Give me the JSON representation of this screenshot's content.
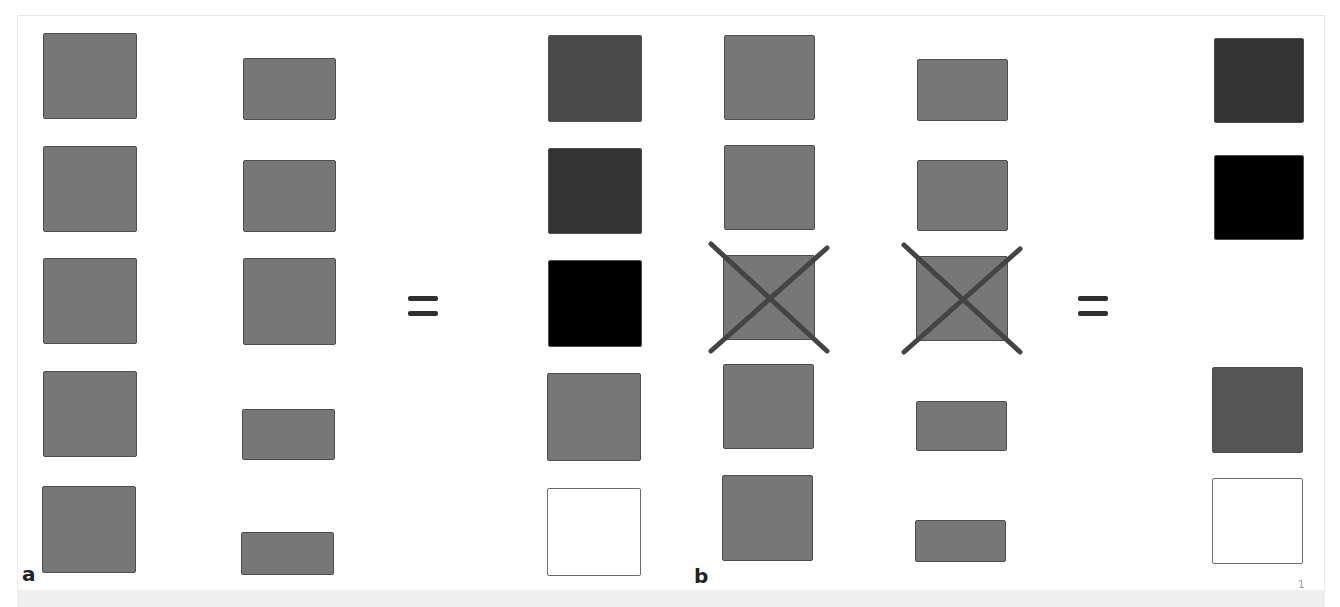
{
  "figure": {
    "page_number": "1",
    "colors": {
      "medium_gray": "#777777",
      "dark_gray": "#4a4a4a",
      "darker_gray": "#333333",
      "black": "#000000",
      "gray_555": "#555555",
      "white": "#ffffff",
      "cross_stroke": "#444444",
      "equals": "#2f2f2f"
    },
    "panels": [
      {
        "label": "a",
        "columns": [
          {
            "name": "left-column",
            "boxes": [
              {
                "x": 43,
                "y": 33,
                "w": 94,
                "h": 86,
                "fill": "#777777",
                "crossed": false
              },
              {
                "x": 43,
                "y": 146,
                "w": 94,
                "h": 86,
                "fill": "#777777",
                "crossed": false
              },
              {
                "x": 43,
                "y": 258,
                "w": 94,
                "h": 86,
                "fill": "#777777",
                "crossed": false
              },
              {
                "x": 43,
                "y": 371,
                "w": 94,
                "h": 86,
                "fill": "#777777",
                "crossed": false
              },
              {
                "x": 42,
                "y": 486,
                "w": 94,
                "h": 87,
                "fill": "#777777",
                "crossed": false
              }
            ]
          },
          {
            "name": "middle-column",
            "boxes": [
              {
                "x": 243,
                "y": 58,
                "w": 93,
                "h": 62,
                "fill": "#777777",
                "crossed": false
              },
              {
                "x": 243,
                "y": 160,
                "w": 93,
                "h": 72,
                "fill": "#777777",
                "crossed": false
              },
              {
                "x": 243,
                "y": 258,
                "w": 93,
                "h": 87,
                "fill": "#777777",
                "crossed": false
              },
              {
                "x": 242,
                "y": 409,
                "w": 93,
                "h": 51,
                "fill": "#777777",
                "crossed": false
              },
              {
                "x": 241,
                "y": 532,
                "w": 93,
                "h": 43,
                "fill": "#777777",
                "crossed": false
              }
            ]
          },
          {
            "name": "result-column",
            "boxes": [
              {
                "x": 548,
                "y": 35,
                "w": 94,
                "h": 87,
                "fill": "#4a4a4a",
                "crossed": false
              },
              {
                "x": 548,
                "y": 148,
                "w": 94,
                "h": 86,
                "fill": "#333333",
                "crossed": false
              },
              {
                "x": 548,
                "y": 260,
                "w": 94,
                "h": 87,
                "fill": "#000000",
                "crossed": false
              },
              {
                "x": 547,
                "y": 373,
                "w": 94,
                "h": 88,
                "fill": "#777777",
                "crossed": false
              },
              {
                "x": 547,
                "y": 488,
                "w": 94,
                "h": 88,
                "fill": "#ffffff",
                "crossed": false
              }
            ]
          }
        ],
        "equals": {
          "x": 408,
          "y": 296
        }
      },
      {
        "label": "b",
        "columns": [
          {
            "name": "left-column",
            "boxes": [
              {
                "x": 724,
                "y": 35,
                "w": 91,
                "h": 85,
                "fill": "#777777",
                "crossed": false
              },
              {
                "x": 724,
                "y": 145,
                "w": 91,
                "h": 85,
                "fill": "#777777",
                "crossed": false
              },
              {
                "x": 723,
                "y": 255,
                "w": 92,
                "h": 85,
                "fill": "#777777",
                "crossed": true
              },
              {
                "x": 723,
                "y": 364,
                "w": 91,
                "h": 85,
                "fill": "#777777",
                "crossed": false
              },
              {
                "x": 722,
                "y": 475,
                "w": 91,
                "h": 86,
                "fill": "#777777",
                "crossed": false
              }
            ]
          },
          {
            "name": "middle-column",
            "boxes": [
              {
                "x": 917,
                "y": 59,
                "w": 91,
                "h": 62,
                "fill": "#777777",
                "crossed": false
              },
              {
                "x": 917,
                "y": 160,
                "w": 91,
                "h": 71,
                "fill": "#777777",
                "crossed": false
              },
              {
                "x": 916,
                "y": 256,
                "w": 92,
                "h": 85,
                "fill": "#777777",
                "crossed": true
              },
              {
                "x": 916,
                "y": 401,
                "w": 91,
                "h": 50,
                "fill": "#777777",
                "crossed": false
              },
              {
                "x": 915,
                "y": 520,
                "w": 91,
                "h": 42,
                "fill": "#777777",
                "crossed": false
              }
            ]
          },
          {
            "name": "result-column",
            "boxes": [
              {
                "x": 1214,
                "y": 38,
                "w": 90,
                "h": 85,
                "fill": "#333333",
                "crossed": false
              },
              {
                "x": 1214,
                "y": 155,
                "w": 90,
                "h": 85,
                "fill": "#000000",
                "crossed": false
              },
              {
                "x": 1212,
                "y": 367,
                "w": 91,
                "h": 86,
                "fill": "#555555",
                "crossed": false
              },
              {
                "x": 1212,
                "y": 478,
                "w": 91,
                "h": 86,
                "fill": "#ffffff",
                "crossed": false
              }
            ]
          }
        ],
        "equals": {
          "x": 1078,
          "y": 296
        }
      }
    ]
  }
}
